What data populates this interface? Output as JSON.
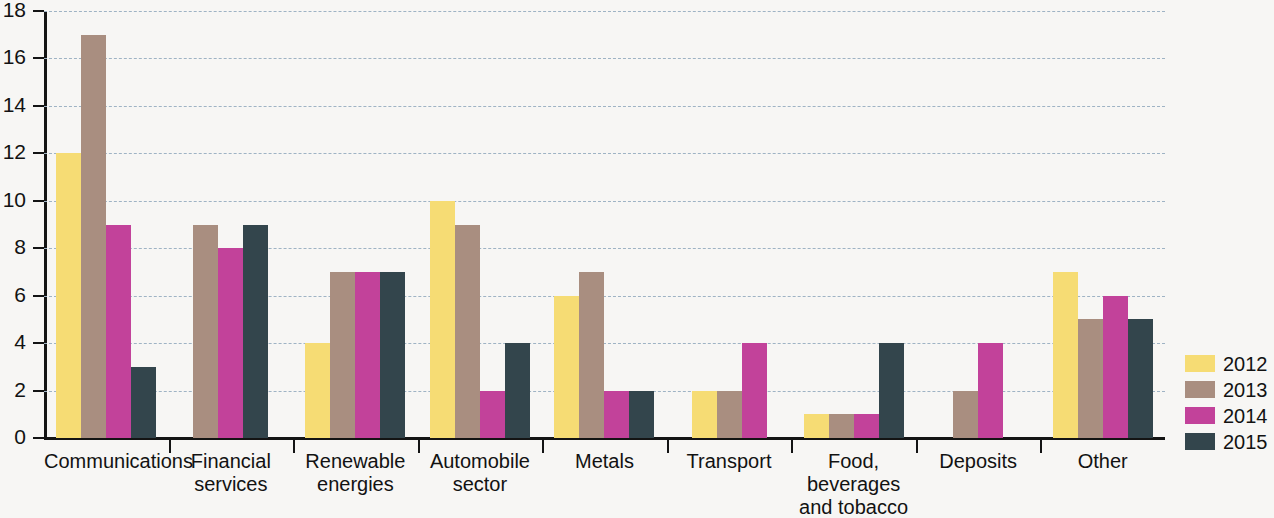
{
  "chart_data": {
    "type": "bar",
    "title": "",
    "subtitle": "",
    "xlabel": "",
    "ylabel": "",
    "ylim": [
      0,
      18
    ],
    "ytick_step": 2,
    "yticks": [
      "18",
      "16",
      "14",
      "12",
      "10",
      "8",
      "6",
      "4",
      "2",
      "0"
    ],
    "grid": "horizontal-dashed",
    "legend_position": "right",
    "categories": [
      "Communications",
      "Financial\nservices",
      "Renewable\nenergies",
      "Automobile\nsector",
      "Metals",
      "Transport",
      "Food, beverages\nand tobacco",
      "Deposits",
      "Other"
    ],
    "series": [
      {
        "name": "2012",
        "color": "#f6dc74",
        "values": [
          12,
          0,
          4,
          10,
          6,
          2,
          1,
          0,
          7
        ]
      },
      {
        "name": "2013",
        "color": "#a98e80",
        "values": [
          17,
          9,
          7,
          9,
          7,
          2,
          1,
          2,
          5
        ]
      },
      {
        "name": "2014",
        "color": "#c2429a",
        "values": [
          9,
          8,
          7,
          2,
          2,
          4,
          1,
          4,
          6
        ]
      },
      {
        "name": "2015",
        "color": "#33454c",
        "values": [
          3,
          9,
          7,
          4,
          2,
          0,
          4,
          0,
          5
        ]
      }
    ]
  },
  "legend": {
    "items": [
      {
        "label": "2012",
        "color": "#f6dc74"
      },
      {
        "label": "2013",
        "color": "#a98e80"
      },
      {
        "label": "2014",
        "color": "#c2429a"
      },
      {
        "label": "2015",
        "color": "#33454c"
      }
    ]
  },
  "colors": {
    "background": "#f7f6f4",
    "axis": "#141414",
    "gridline": "#9fb3c4",
    "text": "#121212"
  }
}
